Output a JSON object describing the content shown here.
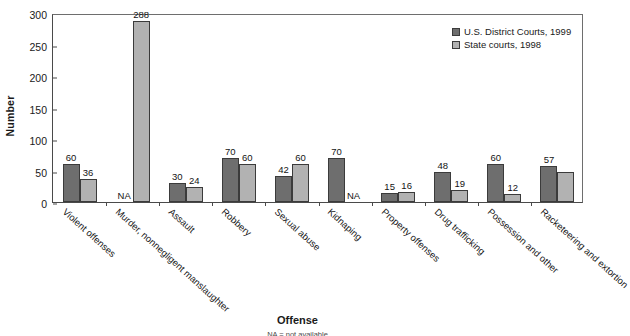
{
  "chart_data": {
    "type": "bar",
    "title": "",
    "xlabel": "Offense",
    "ylabel": "Number",
    "ylim": [
      0,
      300
    ],
    "yticks": [
      0,
      50,
      100,
      150,
      200,
      250,
      300
    ],
    "grid": false,
    "legend_position": "top-right",
    "categories": [
      "Violent offenses",
      "Murder, nonnegligent manslaughter",
      "Assault",
      "Robbery",
      "Sexual abuse",
      "Kidnaping",
      "Property offenses",
      "Drug trafficking",
      "Possession and other",
      "Racketeering and extortion"
    ],
    "series": [
      {
        "name": "U.S. District Courts, 1999",
        "color": "#6e6e6e",
        "values": [
          60,
          null,
          30,
          70,
          42,
          70,
          15,
          48,
          60,
          57
        ],
        "labels": [
          "60",
          "NA",
          "30",
          "70",
          "42",
          "70",
          "15",
          "48",
          "60",
          "57"
        ]
      },
      {
        "name": "State courts, 1998",
        "color": "#b2b2b2",
        "values": [
          36,
          288,
          24,
          60,
          60,
          null,
          16,
          19,
          12,
          47
        ],
        "labels": [
          "36",
          "288",
          "24",
          "60",
          "60",
          "NA",
          "16",
          "19",
          "12",
          ""
        ]
      }
    ],
    "notes": "NA = not available"
  }
}
